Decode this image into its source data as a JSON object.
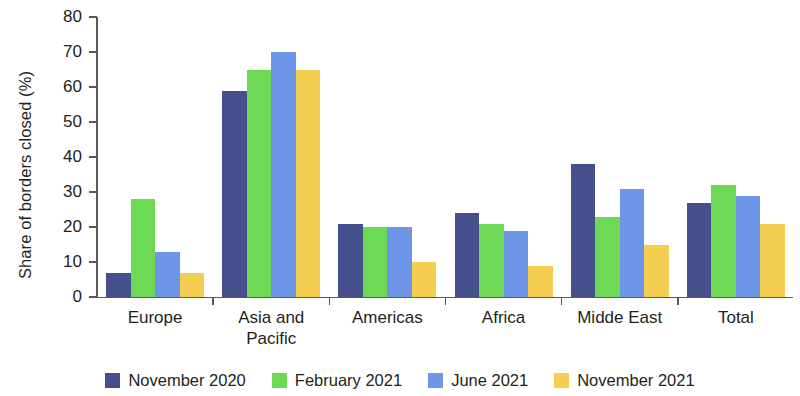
{
  "chart_data": {
    "type": "bar",
    "title": "",
    "xlabel": "",
    "ylabel": "Share of borders closed (%)",
    "ylim": [
      0,
      80
    ],
    "yticks": [
      0,
      10,
      20,
      30,
      40,
      50,
      60,
      70,
      80
    ],
    "grid": false,
    "legend_position": "bottom",
    "categories": [
      "Europe",
      "Asia and Pacific",
      "Americas",
      "Africa",
      "Midde East",
      "Total"
    ],
    "category_lines": [
      [
        "Europe"
      ],
      [
        "Asia and",
        "Pacific"
      ],
      [
        "Americas"
      ],
      [
        "Africa"
      ],
      [
        "Midde East"
      ],
      [
        "Total"
      ]
    ],
    "series": [
      {
        "name": "November 2020",
        "color": "#444f8c",
        "values": [
          7,
          59,
          21,
          24,
          38,
          27
        ]
      },
      {
        "name": "February 2021",
        "color": "#6ed955",
        "values": [
          28,
          65,
          20,
          21,
          23,
          32
        ]
      },
      {
        "name": "June 2021",
        "color": "#6e96e8",
        "values": [
          13,
          70,
          20,
          19,
          31,
          29
        ]
      },
      {
        "name": "November 2021",
        "color": "#f4ce50",
        "values": [
          7,
          65,
          10,
          9,
          15,
          21
        ]
      }
    ]
  },
  "axis": {
    "y_title": "Share of borders closed (%)",
    "tick_labels": [
      "0",
      "10",
      "20",
      "30",
      "40",
      "50",
      "60",
      "70",
      "80"
    ]
  },
  "legend": {
    "items": [
      {
        "label": "November 2020",
        "color": "#444f8c"
      },
      {
        "label": "February 2021",
        "color": "#6ed955"
      },
      {
        "label": "June 2021",
        "color": "#6e96e8"
      },
      {
        "label": "November 2021",
        "color": "#f4ce50"
      }
    ]
  }
}
